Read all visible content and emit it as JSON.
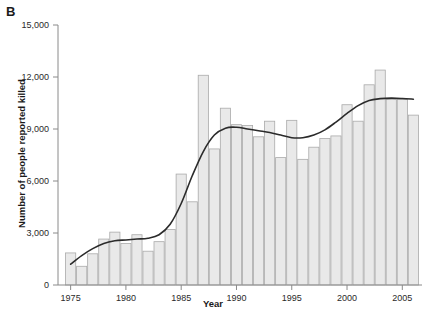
{
  "panel": {
    "label": "B"
  },
  "chart_data": {
    "type": "bar",
    "title": "",
    "xlabel": "Year",
    "ylabel": "Number of people reported killed",
    "xlim": [
      1974.4,
      2006.6
    ],
    "ylim": [
      0,
      15000
    ],
    "grid": false,
    "legend": "none",
    "x_ticks": [
      1975,
      1980,
      1985,
      1990,
      1995,
      2000,
      2005
    ],
    "x_tick_labels": [
      "1975",
      "1980",
      "1985",
      "1990",
      "1995",
      "2000",
      "2005"
    ],
    "y_ticks": [
      0,
      3000,
      6000,
      9000,
      12000,
      15000
    ],
    "y_tick_labels": [
      "0",
      "3,000",
      "6,000",
      "9,000",
      "12,000",
      "15,000"
    ],
    "categories": [
      1975,
      1976,
      1977,
      1978,
      1979,
      1980,
      1981,
      1982,
      1983,
      1984,
      1985,
      1986,
      1987,
      1988,
      1989,
      1990,
      1991,
      1992,
      1993,
      1994,
      1995,
      1996,
      1997,
      1998,
      1999,
      2000,
      2001,
      2002,
      2003,
      2004,
      2005,
      2006
    ],
    "values": [
      1850,
      1080,
      1800,
      2650,
      3050,
      2400,
      2900,
      1950,
      2500,
      3200,
      6400,
      4800,
      12100,
      7850,
      10200,
      9250,
      9200,
      8550,
      9450,
      7350,
      9500,
      7250,
      7950,
      8450,
      8600,
      10400,
      9450,
      11550,
      12400,
      10700,
      10700,
      9800
    ],
    "series": [
      {
        "name": "Number of people reported killed",
        "type": "bar",
        "values": [
          1850,
          1080,
          1800,
          2650,
          3050,
          2400,
          2900,
          1950,
          2500,
          3200,
          6400,
          4800,
          12100,
          7850,
          10200,
          9250,
          9200,
          8550,
          9450,
          7350,
          9500,
          7250,
          7950,
          8450,
          8600,
          10400,
          9450,
          11550,
          12400,
          10700,
          10700,
          9800
        ]
      },
      {
        "name": "Smoothed trend",
        "type": "line",
        "x": [
          1975,
          1976,
          1977,
          1978,
          1979,
          1980,
          1981,
          1982,
          1983,
          1984,
          1985,
          1986,
          1987,
          1988,
          1989,
          1990,
          1991,
          1992,
          1993,
          1994,
          1995,
          1996,
          1997,
          1998,
          1999,
          2000,
          2001,
          2002,
          2003,
          2004,
          2005,
          2006
        ],
        "values": [
          1200,
          1700,
          2100,
          2400,
          2550,
          2600,
          2650,
          2700,
          2900,
          3500,
          4700,
          6300,
          7700,
          8650,
          9050,
          9100,
          9000,
          8900,
          8800,
          8650,
          8500,
          8500,
          8650,
          8950,
          9400,
          9900,
          10350,
          10650,
          10750,
          10780,
          10760,
          10720
        ]
      }
    ],
    "colors": {
      "bar_fill": "#e9e9e9",
      "bar_stroke": "#aaaaaa",
      "line": "#2b2b2b",
      "axis": "#8a8a8a",
      "text": "#1a1a1a",
      "background": "#ffffff"
    }
  }
}
